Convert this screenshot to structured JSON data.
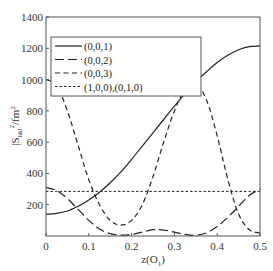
{
  "chart_data": {
    "type": "line",
    "title": "",
    "xlabel": "z(O1)",
    "xlabel_main": "z(O",
    "xlabel_sub": "1",
    "xlabel_close": ")",
    "ylabel": "|S_hkl|^2/fm^2",
    "ylabel_main": "|S",
    "ylabel_sub": "hkl",
    "ylabel_sup": "2",
    "ylabel_unit": "/fm",
    "ylabel_unit_sup": "2",
    "xlim": [
      0,
      0.5
    ],
    "ylim": [
      0,
      1400
    ],
    "xticks": [
      0,
      0.1,
      0.2,
      0.3,
      0.4,
      0.5
    ],
    "xtick_labels": [
      "0",
      "0.1",
      "0.2",
      "0.3",
      "0.4",
      "0.5"
    ],
    "yticks": [
      0,
      200,
      400,
      600,
      800,
      1000,
      1200,
      1400
    ],
    "ytick_labels": [
      "0",
      "200",
      "400",
      "600",
      "800",
      "1000",
      "1200",
      "1400"
    ],
    "grid": false,
    "legend_position": "upper left",
    "x": [
      0,
      0.025,
      0.05,
      0.075,
      0.1,
      0.125,
      0.15,
      0.175,
      0.2,
      0.225,
      0.25,
      0.275,
      0.3,
      0.325,
      0.35,
      0.375,
      0.4,
      0.425,
      0.45,
      0.475,
      0.5
    ],
    "series": [
      {
        "name": "(0,0,1)",
        "style": "solid",
        "values": [
          140,
          145,
          160,
          190,
          230,
          280,
          340,
          410,
          490,
          575,
          660,
          745,
          830,
          910,
          985,
          1050,
          1110,
          1155,
          1190,
          1210,
          1215
        ]
      },
      {
        "name": "(0,0,2)",
        "style": "long-dash",
        "values": [
          310,
          290,
          240,
          170,
          100,
          45,
          15,
          5,
          10,
          25,
          40,
          38,
          25,
          10,
          5,
          20,
          60,
          120,
          190,
          260,
          300
        ]
      },
      {
        "name": "(0,0,3)",
        "style": "dashed",
        "values": [
          1000,
          960,
          800,
          580,
          360,
          200,
          100,
          70,
          100,
          200,
          380,
          600,
          800,
          940,
          975,
          870,
          640,
          360,
          140,
          40,
          20
        ]
      },
      {
        "name": "(1,0,0),(0,1,0)",
        "style": "dotted",
        "values": [
          285,
          285,
          285,
          285,
          285,
          285,
          285,
          285,
          285,
          285,
          285,
          285,
          285,
          285,
          285,
          285,
          285,
          285,
          285,
          285,
          285
        ]
      }
    ]
  }
}
